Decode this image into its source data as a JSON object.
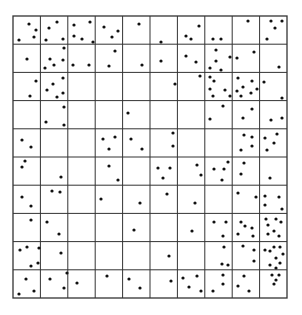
{
  "figure": {
    "type": "quadrat-grid-point-pattern",
    "grid": {
      "left": 13,
      "top": 16,
      "right": 287,
      "bottom": 298,
      "columns": 10,
      "rows": 10,
      "line_color": "#333333",
      "background": "#ffffff"
    },
    "dot_color": "#111111",
    "dot_radius": 1.6,
    "points": [
      [
        29,
        24
      ],
      [
        36,
        30
      ],
      [
        19,
        40
      ],
      [
        34,
        37
      ],
      [
        49,
        28
      ],
      [
        57,
        22
      ],
      [
        46,
        40
      ],
      [
        63,
        39
      ],
      [
        74,
        25
      ],
      [
        90,
        22
      ],
      [
        74,
        36
      ],
      [
        82,
        39
      ],
      [
        93,
        42
      ],
      [
        104,
        27
      ],
      [
        118,
        31
      ],
      [
        112,
        37
      ],
      [
        139,
        24
      ],
      [
        161,
        42
      ],
      [
        186,
        36
      ],
      [
        191,
        39
      ],
      [
        199,
        26
      ],
      [
        213,
        39
      ],
      [
        221,
        39
      ],
      [
        248,
        21
      ],
      [
        271,
        21
      ],
      [
        282,
        21
      ],
      [
        275,
        28
      ],
      [
        267,
        39
      ],
      [
        27,
        59
      ],
      [
        64,
        48
      ],
      [
        50,
        59
      ],
      [
        63,
        60
      ],
      [
        45,
        68
      ],
      [
        54,
        65
      ],
      [
        73,
        65
      ],
      [
        89,
        65
      ],
      [
        115,
        51
      ],
      [
        109,
        66
      ],
      [
        142,
        65
      ],
      [
        161,
        61
      ],
      [
        186,
        56
      ],
      [
        196,
        62
      ],
      [
        216,
        50
      ],
      [
        216,
        61
      ],
      [
        210,
        68
      ],
      [
        221,
        70
      ],
      [
        230,
        57
      ],
      [
        237,
        58
      ],
      [
        254,
        52
      ],
      [
        279,
        67
      ],
      [
        36,
        81
      ],
      [
        30,
        96
      ],
      [
        53,
        84
      ],
      [
        47,
        90
      ],
      [
        63,
        78
      ],
      [
        63,
        93
      ],
      [
        57,
        97
      ],
      [
        175,
        84
      ],
      [
        200,
        76
      ],
      [
        210,
        77
      ],
      [
        214,
        81
      ],
      [
        210,
        89
      ],
      [
        225,
        90
      ],
      [
        213,
        96
      ],
      [
        230,
        96
      ],
      [
        238,
        78
      ],
      [
        252,
        81
      ],
      [
        243,
        87
      ],
      [
        237,
        91
      ],
      [
        257,
        89
      ],
      [
        241,
        96
      ],
      [
        251,
        93
      ],
      [
        264,
        82
      ],
      [
        282,
        98
      ],
      [
        64,
        107
      ],
      [
        46,
        122
      ],
      [
        64,
        125
      ],
      [
        128,
        113
      ],
      [
        223,
        106
      ],
      [
        210,
        119
      ],
      [
        252,
        109
      ],
      [
        243,
        118
      ],
      [
        271,
        120
      ],
      [
        282,
        118
      ],
      [
        22,
        140
      ],
      [
        31,
        147
      ],
      [
        103,
        139
      ],
      [
        115,
        137
      ],
      [
        109,
        149
      ],
      [
        131,
        139
      ],
      [
        142,
        149
      ],
      [
        173,
        133
      ],
      [
        173,
        146
      ],
      [
        244,
        135
      ],
      [
        252,
        137
      ],
      [
        265,
        138
      ],
      [
        277,
        134
      ],
      [
        274,
        143
      ],
      [
        241,
        150
      ],
      [
        252,
        146
      ],
      [
        267,
        150
      ],
      [
        25,
        161
      ],
      [
        22,
        167
      ],
      [
        61,
        177
      ],
      [
        109,
        166
      ],
      [
        118,
        180
      ],
      [
        158,
        168
      ],
      [
        170,
        168
      ],
      [
        163,
        178
      ],
      [
        197,
        165
      ],
      [
        201,
        175
      ],
      [
        214,
        169
      ],
      [
        224,
        169
      ],
      [
        228,
        162
      ],
      [
        222,
        180
      ],
      [
        244,
        163
      ],
      [
        241,
        174
      ],
      [
        270,
        178
      ],
      [
        22,
        197
      ],
      [
        31,
        206
      ],
      [
        52,
        191
      ],
      [
        60,
        192
      ],
      [
        101,
        199
      ],
      [
        140,
        203
      ],
      [
        167,
        194
      ],
      [
        195,
        203
      ],
      [
        238,
        193
      ],
      [
        256,
        197
      ],
      [
        265,
        196
      ],
      [
        279,
        197
      ],
      [
        265,
        205
      ],
      [
        282,
        209
      ],
      [
        31,
        220
      ],
      [
        47,
        222
      ],
      [
        59,
        234
      ],
      [
        134,
        230
      ],
      [
        192,
        231
      ],
      [
        214,
        222
      ],
      [
        226,
        222
      ],
      [
        223,
        236
      ],
      [
        241,
        222
      ],
      [
        245,
        226
      ],
      [
        252,
        228
      ],
      [
        238,
        234
      ],
      [
        253,
        236
      ],
      [
        266,
        219
      ],
      [
        276,
        219
      ],
      [
        281,
        222
      ],
      [
        268,
        225
      ],
      [
        274,
        231
      ],
      [
        268,
        234
      ],
      [
        279,
        236
      ],
      [
        20,
        250
      ],
      [
        27,
        247
      ],
      [
        39,
        248
      ],
      [
        61,
        253
      ],
      [
        38,
        263
      ],
      [
        31,
        266
      ],
      [
        169,
        256
      ],
      [
        224,
        247
      ],
      [
        222,
        264
      ],
      [
        228,
        265
      ],
      [
        243,
        246
      ],
      [
        254,
        250
      ],
      [
        254,
        261
      ],
      [
        265,
        250
      ],
      [
        270,
        251
      ],
      [
        274,
        247
      ],
      [
        280,
        247
      ],
      [
        283,
        254
      ],
      [
        276,
        258
      ],
      [
        280,
        263
      ],
      [
        270,
        265
      ],
      [
        276,
        268
      ],
      [
        26,
        279
      ],
      [
        34,
        291
      ],
      [
        19,
        294
      ],
      [
        50,
        279
      ],
      [
        64,
        288
      ],
      [
        67,
        273
      ],
      [
        77,
        283
      ],
      [
        107,
        276
      ],
      [
        129,
        279
      ],
      [
        140,
        288
      ],
      [
        171,
        281
      ],
      [
        183,
        278
      ],
      [
        197,
        276
      ],
      [
        189,
        287
      ],
      [
        201,
        291
      ],
      [
        213,
        291
      ],
      [
        223,
        275
      ],
      [
        223,
        284
      ],
      [
        244,
        276
      ],
      [
        238,
        286
      ],
      [
        249,
        291
      ],
      [
        272,
        275
      ],
      [
        279,
        275
      ],
      [
        276,
        280
      ],
      [
        274,
        284
      ]
    ]
  }
}
